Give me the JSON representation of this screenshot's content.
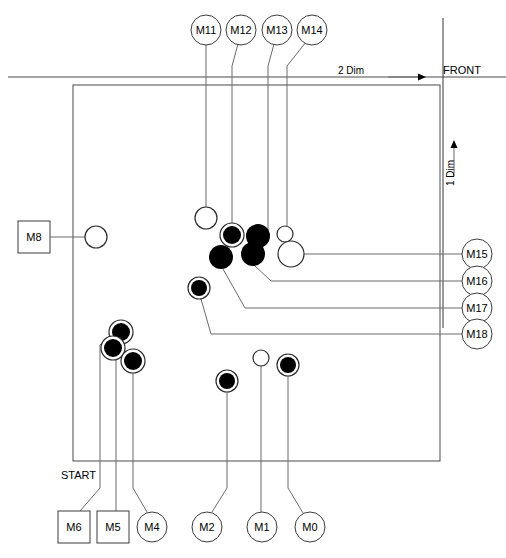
{
  "diagram": {
    "title": "",
    "type": "node-leader-line-layout-diagram",
    "canvas": {
      "width": 506,
      "height": 558
    },
    "axes": {
      "horizontal": {
        "label": "2 Dim",
        "arrow": "right",
        "x": 393,
        "y": 77
      },
      "vertical": {
        "label": "1 Dim",
        "arrow": "up",
        "x": 452,
        "y": 148
      },
      "front": {
        "label": "FRONT",
        "x": 443,
        "y": 76
      }
    },
    "start": {
      "label": "START",
      "x": 61,
      "y": 475
    },
    "frame": {
      "x": 73,
      "y": 85,
      "width": 367,
      "height": 376
    },
    "nodes": [
      {
        "id": "M11",
        "label": "M11",
        "shape": "circle",
        "cx": 206,
        "cy": 30,
        "r": 15
      },
      {
        "id": "M12",
        "label": "M12",
        "shape": "circle",
        "cx": 241,
        "cy": 30,
        "r": 15
      },
      {
        "id": "M13",
        "label": "M13",
        "shape": "circle",
        "cx": 277,
        "cy": 30,
        "r": 15
      },
      {
        "id": "M14",
        "label": "M14",
        "shape": "circle",
        "cx": 312,
        "cy": 30,
        "r": 15
      },
      {
        "id": "M15",
        "label": "M15",
        "shape": "circle",
        "cx": 477,
        "cy": 254,
        "r": 15
      },
      {
        "id": "M16",
        "label": "M16",
        "shape": "circle",
        "cx": 477,
        "cy": 281,
        "r": 15
      },
      {
        "id": "M17",
        "label": "M17",
        "shape": "circle",
        "cx": 477,
        "cy": 308,
        "r": 15
      },
      {
        "id": "M18",
        "label": "M18",
        "shape": "circle",
        "cx": 477,
        "cy": 334,
        "r": 15
      },
      {
        "id": "M8",
        "label": "M8",
        "shape": "square",
        "cx": 34,
        "cy": 237,
        "r": 16
      },
      {
        "id": "M6",
        "label": "M6",
        "shape": "square",
        "cx": 74,
        "cy": 527,
        "r": 16
      },
      {
        "id": "M5",
        "label": "M5",
        "shape": "square",
        "cx": 113,
        "cy": 527,
        "r": 16
      },
      {
        "id": "M4",
        "label": "M4",
        "shape": "circle",
        "cx": 152,
        "cy": 527,
        "r": 15
      },
      {
        "id": "M2",
        "label": "M2",
        "shape": "circle",
        "cx": 207,
        "cy": 527,
        "r": 15
      },
      {
        "id": "M1",
        "label": "M1",
        "shape": "circle",
        "cx": 262,
        "cy": 527,
        "r": 15
      },
      {
        "id": "M0",
        "label": "M0",
        "shape": "circle",
        "cx": 310,
        "cy": 527,
        "r": 15
      }
    ],
    "markers": [
      {
        "for": "M11",
        "style": "open",
        "cx": 206,
        "cy": 218,
        "r": 11
      },
      {
        "for": "M12",
        "style": "ringed-filled",
        "cx": 232,
        "cy": 235,
        "r_fill": 9,
        "r_ring": 12
      },
      {
        "for": "M13",
        "style": "filled",
        "cx": 257,
        "cy": 235,
        "r_fill": 12
      },
      {
        "for": "M13b",
        "style": "filled",
        "cx": 253,
        "cy": 253,
        "r_fill": 12
      },
      {
        "for": "M14",
        "style": "open",
        "cx": 285,
        "cy": 234,
        "r": 8
      },
      {
        "for": "M15",
        "style": "open",
        "cx": 291,
        "cy": 254,
        "r": 13
      },
      {
        "for": "M16",
        "style": "filled",
        "cx": 221,
        "cy": 257,
        "r_fill": 12
      },
      {
        "for": "M17",
        "style": "ringed-filled",
        "cx": 199,
        "cy": 288,
        "r_fill": 8,
        "r_ring": 11
      },
      {
        "for": "M6",
        "style": "ringed-filled",
        "cx": 121,
        "cy": 332,
        "r_fill": 9,
        "r_ring": 12
      },
      {
        "for": "M5",
        "style": "ringed-filled",
        "cx": 113,
        "cy": 348,
        "r_fill": 9,
        "r_ring": 12
      },
      {
        "for": "M4",
        "style": "ringed-filled",
        "cx": 133,
        "cy": 360,
        "r_fill": 9,
        "r_ring": 12
      },
      {
        "for": "M2",
        "style": "ringed-filled",
        "cx": 227,
        "cy": 381,
        "r_fill": 8,
        "r_ring": 11
      },
      {
        "for": "M1",
        "style": "open",
        "cx": 261,
        "cy": 358,
        "r": 8
      },
      {
        "for": "M0",
        "style": "ringed-filled",
        "cx": 288,
        "cy": 365,
        "r_fill": 8,
        "r_ring": 11
      },
      {
        "for": "M8",
        "style": "open",
        "cx": 96,
        "cy": 237,
        "r": 11
      }
    ],
    "leads": [
      {
        "from": "M11",
        "path": "M 206 45 L 206 207"
      },
      {
        "from": "M12",
        "path": "M 238 44 L 232 66 L 232 223"
      },
      {
        "from": "M13",
        "path": "M 274 44 L 268 66 L 268 236"
      },
      {
        "from": "M14",
        "path": "M 306 42 L 287 66 L 287 226"
      },
      {
        "from": "M15",
        "path": "M 462 254 L 304 254"
      },
      {
        "from": "M16",
        "path": "M 462 281 L 271 281 L 253 264"
      },
      {
        "from": "M17",
        "path": "M 462 308 L 245 308 L 222 268"
      },
      {
        "from": "M18",
        "path": "M 462 334 L 210 334 L 200 299"
      },
      {
        "from": "M8",
        "path": "M 50 237 L 85 237"
      },
      {
        "from": "M6",
        "path": "M 80 511 L 100 490 L 100 347 L 112 334"
      },
      {
        "from": "M5",
        "path": "M 116 511 L 116 356"
      },
      {
        "from": "M4",
        "path": "M 147 512 L 133 490 L 133 372"
      },
      {
        "from": "M2",
        "path": "M 212 512 L 227 490 L 227 392"
      },
      {
        "from": "M1",
        "path": "M 261 512 L 261 366"
      },
      {
        "from": "M0",
        "path": "M 303 513 L 288 490 L 288 376"
      }
    ]
  },
  "colors": {
    "line": "#6b6b6b",
    "frame": "#5a5a5a",
    "marker": "#000000",
    "background": "#ffffff",
    "text": "#000000"
  }
}
